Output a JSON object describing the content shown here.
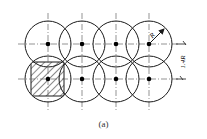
{
  "diagram": {
    "type": "circle-overlap-grid",
    "rows": 2,
    "cols": 4,
    "radius_label": "R",
    "spacing_label": "1.4R",
    "caption": "(a)",
    "hatched_cell": {
      "row": 2,
      "col": 1
    },
    "colors": {
      "line": "#1a1a1a",
      "centerline": "#555555",
      "background": "#ffffff"
    }
  }
}
